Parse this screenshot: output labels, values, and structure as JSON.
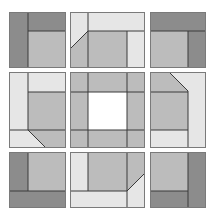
{
  "puzzle": {
    "grid_rows": 3,
    "grid_cols": 3,
    "colors": {
      "dark": "#8c8c8c",
      "mid": "#bcbcbc",
      "light": "#e6e6e6",
      "white": "#ffffff",
      "stroke": "#3a3a3a",
      "frame": "#7a7a7a"
    },
    "tiles": [
      {
        "id": "tile-1",
        "row": 0,
        "col": 0
      },
      {
        "id": "tile-2",
        "row": 0,
        "col": 1
      },
      {
        "id": "tile-3",
        "row": 0,
        "col": 2
      },
      {
        "id": "tile-4",
        "row": 1,
        "col": 0
      },
      {
        "id": "tile-5",
        "row": 1,
        "col": 1
      },
      {
        "id": "tile-6",
        "row": 1,
        "col": 2
      },
      {
        "id": "tile-7",
        "row": 2,
        "col": 0
      },
      {
        "id": "tile-8",
        "row": 2,
        "col": 1
      },
      {
        "id": "tile-9",
        "row": 2,
        "col": 2
      }
    ]
  }
}
